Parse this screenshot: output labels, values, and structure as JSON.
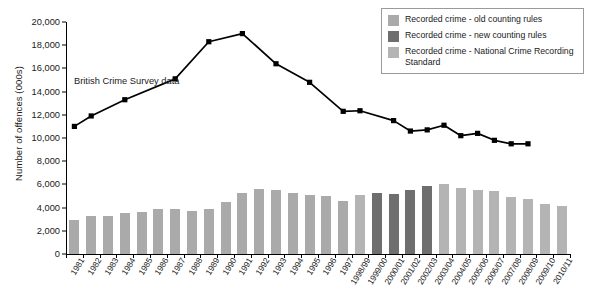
{
  "chart_data": {
    "type": "bar",
    "title": "",
    "xlabel": "",
    "ylabel": "Number of offences (000s)",
    "ylim": [
      0,
      20000
    ],
    "ytick_step": 2000,
    "ytick_labels": [
      "0",
      "2,000",
      "4,000",
      "6,000",
      "8,000",
      "10,000",
      "12,000",
      "14,000",
      "16,000",
      "18,000",
      "20,000"
    ],
    "grid": false,
    "legend_position": "top-right",
    "categories": [
      "1981",
      "1982",
      "1983",
      "1984",
      "1985",
      "1986",
      "1987",
      "1988",
      "1989",
      "1990",
      "1991",
      "1992",
      "1993",
      "1994",
      "1995",
      "1996",
      "1997",
      "1998/99",
      "1999/00",
      "2000/01",
      "2001/02",
      "2002/03",
      "2003/04",
      "2004/05",
      "2005/06",
      "2006/07",
      "2007/08",
      "2008/09",
      "2009/10",
      "2010/11"
    ],
    "series": [
      {
        "name": "Recorded crime - old counting rules",
        "kind": "bar",
        "color": "#aaaaaa",
        "values": [
          2900,
          3250,
          3250,
          3500,
          3600,
          3850,
          3900,
          3700,
          3850,
          4500,
          5250,
          5600,
          5530,
          5250,
          5100,
          5040,
          4600,
          null,
          null,
          null,
          null,
          null,
          null,
          null,
          null,
          null,
          null,
          null,
          null,
          null
        ]
      },
      {
        "name": "Recorded crime - new counting rules",
        "kind": "bar",
        "color": "#6e6e6e",
        "values": [
          null,
          null,
          null,
          null,
          null,
          null,
          null,
          null,
          null,
          null,
          null,
          null,
          null,
          null,
          null,
          null,
          null,
          null,
          5300,
          5200,
          5550,
          5900,
          null,
          null,
          null,
          null,
          null,
          null,
          null,
          null
        ]
      },
      {
        "name": "Recorded crime - National Crime Recording Standard",
        "kind": "bar",
        "color": "#b4b4b4",
        "values": [
          null,
          null,
          null,
          null,
          null,
          null,
          null,
          null,
          null,
          null,
          null,
          null,
          null,
          null,
          null,
          null,
          null,
          5100,
          null,
          null,
          null,
          null,
          6000,
          5650,
          5550,
          5420,
          4950,
          4700,
          4340,
          4150
        ]
      },
      {
        "name": "British Crime Survey data",
        "kind": "line",
        "color": "#000000",
        "values": [
          11000,
          11900,
          null,
          13300,
          null,
          null,
          15100,
          null,
          18300,
          null,
          19000,
          null,
          16400,
          null,
          14800,
          null,
          12300,
          12350,
          null,
          11500,
          10600,
          10700,
          11100,
          10200,
          10400,
          9800,
          9500,
          9500,
          null,
          null
        ]
      }
    ],
    "annotation": "British Crime Survey data"
  },
  "legend": {
    "items": [
      {
        "label": "Recorded crime - old counting rules",
        "color": "#aaaaaa"
      },
      {
        "label": "Recorded crime - new counting rules",
        "color": "#6e6e6e"
      },
      {
        "label": "Recorded crime - National Crime Recording Standard",
        "color": "#b4b4b4"
      }
    ]
  }
}
